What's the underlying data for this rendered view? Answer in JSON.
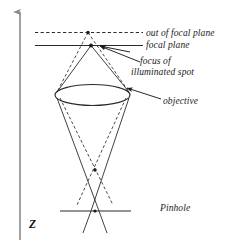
{
  "figure": {
    "axis": {
      "name": "z-axis",
      "label": "Z",
      "direction": "up"
    },
    "labels": {
      "out_of_focal_plane": "out of focal plane",
      "focal_plane": "focal plane",
      "focus_of_spot_line1": "focus of",
      "focus_of_spot_line2": "illuminated spot",
      "objective": "objective",
      "pinhole": "Pinhole"
    },
    "colors": {
      "ink": "#1a1a1a",
      "line": "#2b2b2b",
      "axis": "#8a8a8a",
      "background": "#ffffff"
    },
    "elements": {
      "out_of_focal_plane_line_style": "dashed",
      "focal_plane_line_style": "solid",
      "objective_shape": "ellipse",
      "pinhole_line_style": "solid",
      "ray_styles": [
        "solid",
        "dashed"
      ]
    }
  }
}
